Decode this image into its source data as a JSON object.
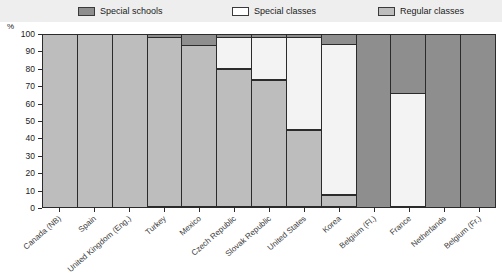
{
  "legend": {
    "items": [
      {
        "label": "Special schools",
        "color": "#8e8e8e",
        "key": "special_schools"
      },
      {
        "label": "Special classes",
        "color": "#f3f3f3",
        "key": "special_classes"
      },
      {
        "label": "Regular classes",
        "color": "#bdbdbd",
        "key": "regular_classes"
      }
    ]
  },
  "axis": {
    "y_unit_label": "%",
    "y_ticks": [
      "100",
      "90",
      "80",
      "70",
      "60",
      "50",
      "40",
      "30",
      "20",
      "10",
      "0"
    ]
  },
  "chart_data": {
    "type": "bar",
    "title": "",
    "subtitle": "",
    "xlabel": "",
    "ylabel": "%",
    "ylim": [
      0,
      100
    ],
    "stacked": true,
    "grid": false,
    "legend_position": "top",
    "categories": [
      "Canada (NB)",
      "Spain",
      "United Kingdom (Eng.)",
      "Turkey",
      "Mexico",
      "Czech Republic",
      "Slovak Republic",
      "United States",
      "Korea",
      "Belgium (Fl.)",
      "France",
      "Netherlands",
      "Belgium (Fr.)"
    ],
    "series": [
      {
        "name": "Special schools",
        "color": "#8e8e8e",
        "values": [
          0,
          0,
          0,
          1,
          6,
          1,
          1,
          1,
          5,
          100,
          34,
          100,
          100
        ]
      },
      {
        "name": "Special classes",
        "color": "#f3f3f3",
        "values": [
          0,
          0,
          0,
          0,
          0,
          19,
          25,
          54,
          88,
          0,
          66,
          0,
          0
        ]
      },
      {
        "name": "Regular classes",
        "color": "#bdbdbd",
        "values": [
          100,
          100,
          100,
          99,
          94,
          80,
          74,
          45,
          7,
          0,
          0,
          0,
          0
        ]
      }
    ]
  }
}
